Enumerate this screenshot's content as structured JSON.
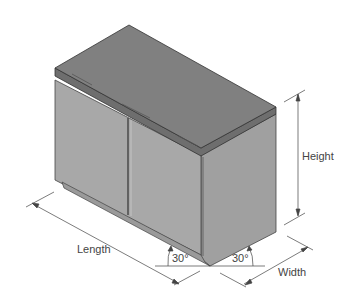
{
  "diagram": {
    "labels": {
      "height": "Height",
      "length": "Length",
      "width": "Width",
      "angle_left": "30°",
      "angle_right": "30°"
    },
    "colors": {
      "top": "#7d7d7d",
      "top_edge": "#6a6a6a",
      "front": "#a3a3a3",
      "side": "#9a9a9a",
      "line": "#333333"
    }
  }
}
